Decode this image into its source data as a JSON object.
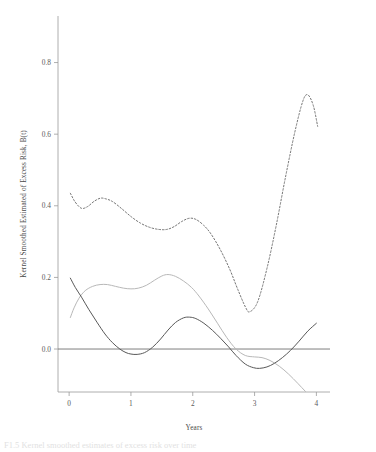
{
  "figure": {
    "caption_fragment": "F1.5 Kernel smoothed estimates of excess risk over time"
  },
  "chart_data": {
    "type": "line",
    "title": "",
    "xlabel": "Years",
    "ylabel": "Kernel Smoothed Estimated of Excess Risk, B(t)",
    "xlim": [
      -0.18,
      4.22
    ],
    "ylim": [
      -0.12,
      0.93
    ],
    "xticks": [
      0,
      1,
      2,
      3,
      4
    ],
    "xtick_labels": [
      "0",
      "1",
      "2",
      "3",
      "4"
    ],
    "yticks": [
      0.0,
      0.2,
      0.4,
      0.6,
      0.8
    ],
    "ytick_labels": [
      "0.0",
      "0.2",
      "0.4",
      "0.6",
      "0.8"
    ],
    "grid": false,
    "legend": "none",
    "reference_line": {
      "name": "zero-line",
      "y": 0.0,
      "color": "#6f6f6f"
    },
    "series": [
      {
        "name": "dashed-upper-estimate",
        "style": "dashed",
        "color": "#6e6e6e",
        "x": [
          0.02,
          0.1,
          0.2,
          0.3,
          0.4,
          0.5,
          0.58,
          0.7,
          0.85,
          1.0,
          1.15,
          1.3,
          1.45,
          1.58,
          1.7,
          1.82,
          1.94,
          2.05,
          2.18,
          2.3,
          2.45,
          2.6,
          2.72,
          2.85,
          2.92,
          3.05,
          3.2,
          3.35,
          3.5,
          3.65,
          3.78,
          3.86,
          3.95,
          4.02
        ],
        "y": [
          0.435,
          0.41,
          0.393,
          0.398,
          0.412,
          0.421,
          0.42,
          0.412,
          0.392,
          0.37,
          0.352,
          0.34,
          0.334,
          0.334,
          0.342,
          0.356,
          0.365,
          0.362,
          0.345,
          0.32,
          0.276,
          0.222,
          0.17,
          0.118,
          0.104,
          0.132,
          0.225,
          0.345,
          0.48,
          0.605,
          0.692,
          0.71,
          0.68,
          0.622
        ]
      },
      {
        "name": "solid-light-estimate",
        "style": "solid",
        "color": "#b8b8b8",
        "x": [
          0.02,
          0.08,
          0.16,
          0.26,
          0.38,
          0.5,
          0.62,
          0.75,
          0.88,
          1.0,
          1.12,
          1.25,
          1.38,
          1.5,
          1.6,
          1.72,
          1.85,
          1.98,
          2.1,
          2.25,
          2.4,
          2.55,
          2.7,
          2.85,
          3.0,
          3.12,
          3.25,
          3.4,
          3.55,
          3.7,
          3.82,
          3.92,
          4.0
        ],
        "y": [
          0.088,
          0.115,
          0.142,
          0.163,
          0.175,
          0.18,
          0.18,
          0.175,
          0.17,
          0.168,
          0.17,
          0.178,
          0.192,
          0.204,
          0.208,
          0.203,
          0.19,
          0.172,
          0.148,
          0.112,
          0.072,
          0.032,
          0.0,
          -0.018,
          -0.022,
          -0.024,
          -0.032,
          -0.048,
          -0.07,
          -0.096,
          -0.118,
          -0.135,
          -0.148
        ]
      },
      {
        "name": "solid-dark-estimate",
        "style": "solid",
        "color": "#585858",
        "x": [
          0.02,
          0.1,
          0.2,
          0.32,
          0.45,
          0.58,
          0.7,
          0.82,
          0.92,
          1.0,
          1.1,
          1.22,
          1.35,
          1.48,
          1.6,
          1.72,
          1.85,
          1.95,
          2.05,
          2.18,
          2.32,
          2.45,
          2.58,
          2.7,
          2.85,
          2.98,
          3.08,
          3.2,
          3.32,
          3.45,
          3.58,
          3.72,
          3.86,
          4.0
        ],
        "y": [
          0.198,
          0.172,
          0.145,
          0.11,
          0.075,
          0.042,
          0.018,
          0.0,
          -0.01,
          -0.014,
          -0.015,
          -0.01,
          0.005,
          0.028,
          0.053,
          0.074,
          0.087,
          0.089,
          0.085,
          0.072,
          0.052,
          0.03,
          0.006,
          -0.018,
          -0.042,
          -0.052,
          -0.054,
          -0.05,
          -0.04,
          -0.024,
          -0.004,
          0.022,
          0.05,
          0.072
        ]
      }
    ]
  }
}
